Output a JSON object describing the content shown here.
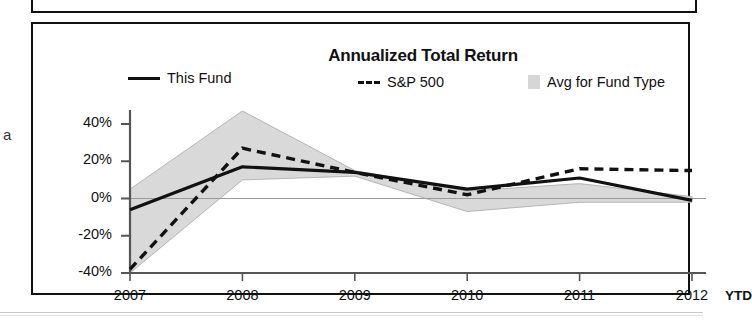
{
  "card": {
    "title": "Annualized Total Return",
    "left_margin_glyph": "a"
  },
  "legend": [
    {
      "key": "line-solid",
      "label": "This Fund"
    },
    {
      "key": "line-dashed",
      "label": "S&P 500"
    },
    {
      "key": "area-swatch",
      "label": "Avg for Fund Type"
    }
  ],
  "axis": {
    "y_ticks": [
      "40%",
      "20%",
      "0%",
      "-20%",
      "-40%"
    ],
    "x_ticks": [
      "2007",
      "2008",
      "2009",
      "2010",
      "2011",
      "2012"
    ],
    "x_suffix": "YTD"
  },
  "colors": {
    "line": "#111111",
    "band": "#d9d9d9",
    "band_edge": "#b5b5b5",
    "frame": "#111111",
    "axis": "#555555"
  },
  "chart_data": {
    "type": "line",
    "title": "Annualized Total Return",
    "xlabel": "",
    "ylabel": "",
    "x": [
      "2007",
      "2008",
      "2009",
      "2010",
      "2011",
      "2012"
    ],
    "x_note": "2012 is YTD",
    "ylim": [
      -40,
      50
    ],
    "y_ticks": [
      -40,
      -20,
      0,
      20,
      40
    ],
    "y_unit": "percent",
    "grid": false,
    "legend_position": "top",
    "series": [
      {
        "name": "This Fund",
        "style": "solid",
        "values": [
          -6,
          17,
          14,
          5,
          11,
          -1
        ]
      },
      {
        "name": "S&P 500",
        "style": "dashed",
        "values": [
          -38,
          27,
          14,
          2,
          16,
          15
        ]
      },
      {
        "name": "Avg for Fund Type",
        "style": "band",
        "upper": [
          5,
          47,
          15,
          4,
          8,
          1
        ],
        "lower": [
          -40,
          10,
          12,
          -7,
          -2,
          -2
        ]
      }
    ]
  }
}
